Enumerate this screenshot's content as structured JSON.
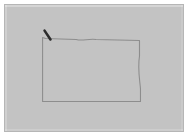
{
  "app": {
    "title": "Drawing Canvas",
    "surface_label": "sketch-area"
  },
  "canvas": {
    "background_color": "#c3c3c3",
    "border_color": "#b6b6b6",
    "page_background_color": "#ffffff",
    "width": 180,
    "height": 128,
    "margin": 4
  },
  "strokes": [
    {
      "id": "rectangle-outline",
      "name": "hand-drawn-rectangle",
      "kind": "freehand-path",
      "color": "#8d8d8d",
      "width": 1.1,
      "closed": false,
      "description": "Roughly rectangular hand drawn outline with a bulging right side and a slight wave along the top edge",
      "path": "M 38 33 L 38 98 L 137 98 L 137 85 C 136 74 134 64 136 52 L 136 36 L 92 35 C 84 34 78 37 72 35 L 41 34 Z"
    },
    {
      "id": "pen-stroke",
      "name": "dark-pen-stroke",
      "kind": "freehand-path",
      "color": "#2b2b2b",
      "width": 2.6,
      "closed": false,
      "description": "Short thick dark diagonal stroke at the top left corner, like a pen tip or cursor mark",
      "path": "M 40 26 L 46 35"
    }
  ],
  "cursor": {
    "visible": false
  }
}
